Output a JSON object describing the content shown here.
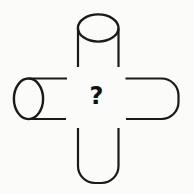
{
  "figure": {
    "center_label": "?",
    "parts": {
      "top": "cylinder-open-end-top",
      "left": "cylinder-open-end-left",
      "right": "tube-rounded-cap-right",
      "bottom": "tube-rounded-cap-bottom"
    }
  },
  "colors": {
    "background": "#fbfbf9",
    "line": "#1a1a1a",
    "label": "#111111"
  }
}
